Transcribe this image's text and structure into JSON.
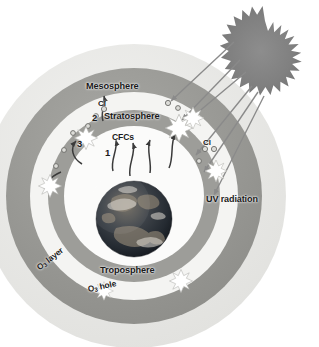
{
  "diagram": {
    "background_color": "#ffffff"
  },
  "layers": {
    "mesosphere": {
      "label": "Mesosphere",
      "band_color": "#e8e8e6",
      "outer_radius": 152,
      "inner_radius": 128
    },
    "ozone_layer": {
      "label_o3_layer": "O",
      "label_o3_layer_sub": "3",
      "label_o3_layer_rest": " layer",
      "band_color": "#9a9a96",
      "outer_radius": 128,
      "inner_radius": 104
    },
    "stratosphere": {
      "label": "Stratosphere",
      "band_color": "#f3f3f1",
      "outer_radius": 104,
      "inner_radius": 86
    },
    "ozone_hole": {
      "label_o3_hole": "O",
      "label_o3_hole_sub": "3",
      "label_o3_hole_rest": " hole"
    },
    "inner_ozone_band": {
      "band_color": "#9a9a96",
      "outer_radius": 86,
      "inner_radius": 70
    },
    "troposphere": {
      "label": "Troposphere",
      "band_color": "#fbfbfa",
      "outer_radius": 70
    }
  },
  "earth": {
    "name": "earth-globe",
    "center_x": 134,
    "center_y": 219,
    "radius": 38,
    "ocean_color": "#2b3640",
    "land_color": "#7d7468",
    "cloud_color": "#d8d4cc"
  },
  "sun": {
    "name": "sun",
    "center_x": 265,
    "center_y": 57,
    "radius": 36,
    "spikes": 28,
    "color": "#7f7f7f"
  },
  "annotations": {
    "mesosphere": "Mesosphere",
    "stratosphere": "Stratosphere",
    "troposphere": "Troposphere",
    "cfcs": "CFCs",
    "cl_left": "Cl",
    "cl_right": "Cl",
    "uv_radiation": "UV radiation",
    "step_1": "1",
    "step_2": "2",
    "step_3": "3",
    "o3_layer_prefix": "O",
    "o3_layer_sub": "3",
    "o3_layer_suffix": " layer",
    "o3_hole_prefix": "O",
    "o3_hole_sub": "3",
    "o3_hole_suffix": " hole"
  },
  "legend_steps": [
    {
      "number": "1",
      "meaning": "CFCs rise from the surface into the stratosphere"
    },
    {
      "number": "2",
      "meaning": "UV radiation breaks CFCs releasing Cl atoms"
    },
    {
      "number": "3",
      "meaning": "Cl destroys ozone creating the ozone hole"
    }
  ],
  "colors": {
    "arrow_uv": "#8a8a8a",
    "arrow_cfc": "#3a3a3a",
    "starburst_fill": "#ffffff",
    "starburst_stroke": "#b8b8b4",
    "chlorine_dot_fill": "#d9d9d5",
    "chlorine_dot_stroke": "#6a6a66",
    "text": "#1a1a1a"
  },
  "chlorine_dots": [
    {
      "x": 104,
      "y": 110
    },
    {
      "x": 96,
      "y": 115
    },
    {
      "x": 89,
      "y": 126
    },
    {
      "x": 73,
      "y": 133
    },
    {
      "x": 66,
      "y": 148
    },
    {
      "x": 57,
      "y": 165
    },
    {
      "x": 168,
      "y": 104
    },
    {
      "x": 178,
      "y": 108
    },
    {
      "x": 205,
      "y": 149
    },
    {
      "x": 213,
      "y": 148
    },
    {
      "x": 200,
      "y": 160
    }
  ],
  "starbursts": [
    {
      "x": 86,
      "y": 138,
      "r": 11
    },
    {
      "x": 50,
      "y": 186,
      "r": 11
    },
    {
      "x": 178,
      "y": 128,
      "r": 13
    },
    {
      "x": 192,
      "y": 119,
      "r": 11
    },
    {
      "x": 216,
      "y": 171,
      "r": 11
    },
    {
      "x": 181,
      "y": 281,
      "r": 11
    },
    {
      "x": 104,
      "y": 291,
      "r": 9
    }
  ]
}
